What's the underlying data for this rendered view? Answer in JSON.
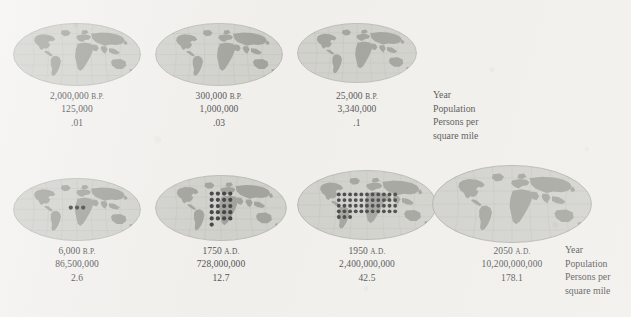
{
  "figure": {
    "type": "world-population-growth-pictogram",
    "background_color": "#f1f0ed",
    "ocean_color": "#c9c9c4",
    "land_color": "#8e8e88",
    "graticule_color": "#b4b4ae",
    "dot_color": "#17171a",
    "globe_outline_color": "#9a9a94"
  },
  "legend": {
    "top": {
      "year_label": "Year",
      "population_label": "Population",
      "density_label_line1": "Persons per",
      "density_label_line2": "square mile"
    },
    "bottom": {
      "year_label": "Year",
      "population_label": "Population",
      "density_label_line1": "Persons per",
      "density_label_line2": "square mile"
    }
  },
  "chart_data": {
    "type": "pictogram",
    "title": "",
    "xlabel": "",
    "ylabel": "",
    "row_labels": [
      "Year",
      "Population",
      "Persons per square mile"
    ],
    "categories": [
      "2,000,000 B.P.",
      "300,000 B.P.",
      "25,000 B.P.",
      "6,000 B.P.",
      "1750 A.D.",
      "1950 A.D.",
      "2050 A.D."
    ],
    "series": [
      {
        "name": "Population",
        "values": [
          125000,
          1000000,
          3340000,
          86500000,
          728000000,
          2400000000,
          10200000000
        ]
      },
      {
        "name": "Persons per square mile",
        "values": [
          0.01,
          0.03,
          0.1,
          2.6,
          12.7,
          42.5,
          178.1
        ]
      },
      {
        "name": "Dots shown",
        "values": [
          0,
          0,
          0,
          3,
          21,
          47,
          185
        ]
      }
    ],
    "panels": [
      {
        "row": 1,
        "index": 0,
        "year_value": "2,000,000",
        "year_era": "B.P.",
        "year_text": "2,000,000 B.P.",
        "population_text": "125,000",
        "population_value": 125000,
        "density_text": ".01",
        "density_value": 0.01,
        "dots": {
          "count": 0,
          "cols": 0,
          "rows": 0,
          "remainder": 0
        }
      },
      {
        "row": 1,
        "index": 1,
        "year_value": "300,000",
        "year_era": "B.P.",
        "year_text": "300,000 B.P.",
        "population_text": "1,000,000",
        "population_value": 1000000,
        "density_text": ".03",
        "density_value": 0.03,
        "dots": {
          "count": 0,
          "cols": 0,
          "rows": 0,
          "remainder": 0
        }
      },
      {
        "row": 1,
        "index": 2,
        "year_value": "25,000",
        "year_era": "B.P.",
        "year_text": "25,000 B.P.",
        "population_text": "3,340,000",
        "population_value": 3340000,
        "density_text": ".1",
        "density_value": 0.1,
        "dots": {
          "count": 0,
          "cols": 0,
          "rows": 0,
          "remainder": 0
        }
      },
      {
        "row": 2,
        "index": 0,
        "year_value": "6,000",
        "year_era": "B.P.",
        "year_text": "6,000 B.P.",
        "population_text": "86,500,000",
        "population_value": 86500000,
        "density_text": "2.6",
        "density_value": 2.6,
        "dots": {
          "count": 3,
          "cols": 3,
          "rows": 1,
          "remainder": 0
        }
      },
      {
        "row": 2,
        "index": 1,
        "year_value": "1750",
        "year_era": "A.D.",
        "year_text": "1750 A.D.",
        "population_text": "728,000,000",
        "population_value": 728000000,
        "density_text": "12.7",
        "density_value": 12.7,
        "dots": {
          "count": 21,
          "cols": 4,
          "rows": 5,
          "remainder": 1
        }
      },
      {
        "row": 2,
        "index": 2,
        "year_value": "1950",
        "year_era": "A.D.",
        "year_text": "1950 A.D.",
        "population_text": "2,400,000,000",
        "population_value": 2400000000,
        "density_text": "42.5",
        "density_value": 42.5,
        "dots": {
          "count": 47,
          "cols": 11,
          "rows": 4,
          "remainder": 3
        }
      },
      {
        "row": 2,
        "index": 2049,
        "year_value": "2050",
        "year_era": "A.D.",
        "year_text": "2050 A.D.",
        "population_text": "10,200,000,000",
        "population_value": 10200000000,
        "density_text": "178.1",
        "density_value": 178.1,
        "dots": {
          "count": 185,
          "cols": 17,
          "rows": 11,
          "remainder": -2
        }
      }
    ]
  }
}
